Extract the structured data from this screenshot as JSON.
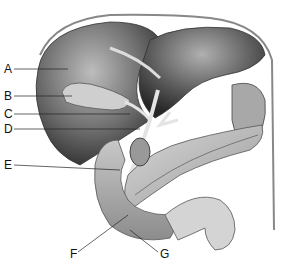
{
  "diagram": {
    "labels": [
      {
        "id": "A",
        "text": "A",
        "x": 4,
        "y": 63
      },
      {
        "id": "B",
        "text": "B",
        "x": 4,
        "y": 90
      },
      {
        "id": "C",
        "text": "C",
        "x": 4,
        "y": 108
      },
      {
        "id": "D",
        "text": "D",
        "x": 4,
        "y": 123
      },
      {
        "id": "E",
        "text": "E",
        "x": 4,
        "y": 159
      },
      {
        "id": "F",
        "text": "F",
        "x": 70,
        "y": 252
      },
      {
        "id": "G",
        "text": "G",
        "x": 160,
        "y": 252
      }
    ]
  }
}
